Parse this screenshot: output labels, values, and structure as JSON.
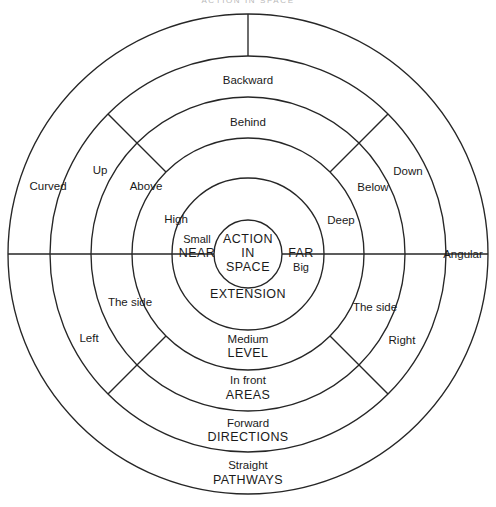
{
  "page": {
    "title": "Action in Space",
    "header_faint": "ACTION IN SPACE"
  },
  "diagram": {
    "type": "concentric-ring-diagram",
    "center_label_line1": "ACTION",
    "center_label_line2": "IN",
    "center_label_line3": "SPACE",
    "geometry": {
      "center_x": 248,
      "center_y": 254,
      "radii": [
        34,
        76,
        116,
        157,
        198,
        240
      ]
    },
    "rings": [
      {
        "index": 0,
        "name": "core",
        "category": "",
        "labels": [
          "ACTION",
          "IN",
          "SPACE"
        ]
      },
      {
        "index": 1,
        "name": "extension-ring",
        "category": "EXTENSION",
        "labels": [
          "Small",
          "NEAR",
          "FAR",
          "Big",
          "EXTENSION"
        ]
      },
      {
        "index": 2,
        "name": "level-ring",
        "category": "LEVEL",
        "labels": [
          "High",
          "Deep",
          "Medium",
          "LEVEL"
        ]
      },
      {
        "index": 3,
        "name": "areas-ring",
        "category": "AREAS",
        "labels": [
          "Behind",
          "Above",
          "Below",
          "The side",
          "The side",
          "In front",
          "AREAS"
        ]
      },
      {
        "index": 4,
        "name": "directions-ring",
        "category": "DIRECTIONS",
        "labels": [
          "Backward",
          "Up",
          "Down",
          "Left",
          "Right",
          "Forward",
          "DIRECTIONS"
        ]
      },
      {
        "index": 5,
        "name": "pathways-ring",
        "category": "PATHWAYS",
        "labels": [
          "Curved",
          "Angular",
          "Straight",
          "PATHWAYS"
        ]
      }
    ],
    "labels": {
      "core": {
        "l1": "ACTION",
        "l2": "IN",
        "l3": "SPACE"
      },
      "extension": {
        "small": "Small",
        "near": "NEAR",
        "far": "FAR",
        "big": "Big",
        "category": "EXTENSION"
      },
      "level": {
        "high": "High",
        "deep": "Deep",
        "medium": "Medium",
        "category": "LEVEL"
      },
      "areas": {
        "behind": "Behind",
        "above": "Above",
        "below": "Below",
        "side_left": "The side",
        "side_right": "The side",
        "in_front": "In front",
        "category": "AREAS"
      },
      "directions": {
        "backward": "Backward",
        "up": "Up",
        "down": "Down",
        "left": "Left",
        "right": "Right",
        "forward": "Forward",
        "category": "DIRECTIONS"
      },
      "pathways": {
        "curved": "Curved",
        "angular": "Angular",
        "straight": "Straight",
        "category": "PATHWAYS"
      }
    }
  },
  "colors": {
    "stroke": "#262626",
    "text": "#1a1a1a",
    "background": "#ffffff",
    "header_faint": "#b9b9b9"
  }
}
